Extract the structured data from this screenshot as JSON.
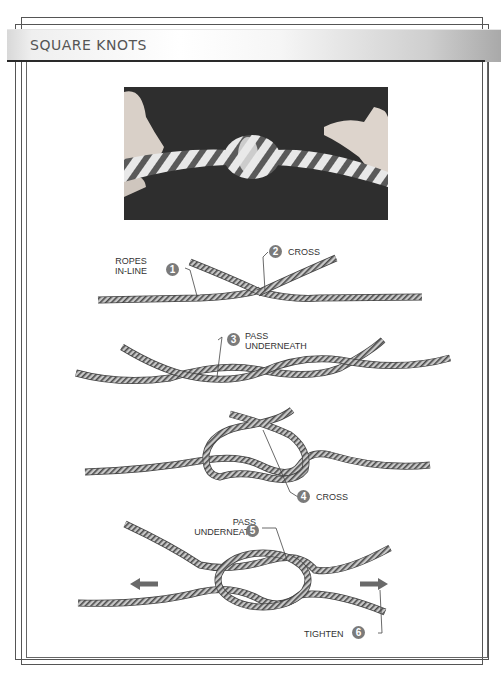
{
  "page": {
    "title": "SQUARE KNOTS"
  },
  "photo": {
    "alt": "Photo of a tied square knot in striped rope held by two hands"
  },
  "steps": [
    {
      "number": "1",
      "label_line1": "ROPES",
      "label_line2": "IN-LINE"
    },
    {
      "number": "2",
      "label_line1": "CROSS",
      "label_line2": ""
    },
    {
      "number": "3",
      "label_line1": "PASS",
      "label_line2": "UNDERNEATH"
    },
    {
      "number": "4",
      "label_line1": "CROSS",
      "label_line2": ""
    },
    {
      "number": "5",
      "label_line1": "PASS",
      "label_line2": "UNDERNEATH"
    },
    {
      "number": "6",
      "label_line1": "TIGHTEN",
      "label_line2": ""
    }
  ],
  "colors": {
    "badge": "#7a7a7a",
    "rope_fill": "#bdbdbd",
    "rope_stripe": "#555555",
    "arrow": "#6a6a6a",
    "photo_bg": "#2d2d2d"
  },
  "icons": {
    "pull_left": "arrow-left-icon",
    "pull_right": "arrow-right-icon"
  }
}
